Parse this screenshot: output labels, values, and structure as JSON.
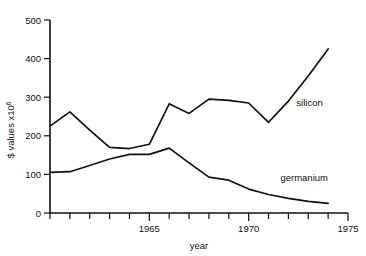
{
  "chart_data": {
    "type": "line",
    "title": "",
    "xlabel": "year",
    "ylabel": "$ values x10",
    "ylabel_exponent": "6",
    "xlim": [
      1960,
      1975
    ],
    "ylim": [
      0,
      500
    ],
    "grid": false,
    "legend_position": "inline-right",
    "x_ticks_major": [
      1965,
      1970,
      1975
    ],
    "x_tick_labels": [
      "1965",
      "1970",
      "1975"
    ],
    "x_ticks_all": [
      1960,
      1961,
      1962,
      1963,
      1964,
      1965,
      1966,
      1967,
      1968,
      1969,
      1970,
      1971,
      1972,
      1973,
      1974,
      1975
    ],
    "y_ticks": [
      0,
      100,
      200,
      300,
      400,
      500
    ],
    "y_tick_labels": [
      "0",
      "100",
      "200",
      "300",
      "400",
      "500"
    ],
    "x": [
      1960,
      1961,
      1962,
      1963,
      1964,
      1965,
      1966,
      1967,
      1968,
      1969,
      1970,
      1971,
      1972,
      1973,
      1974
    ],
    "series": [
      {
        "name": "silicon",
        "label": "silicon",
        "values": [
          225,
          262,
          215,
          170,
          167,
          178,
          283,
          258,
          295,
          292,
          285,
          235,
          290,
          355,
          425
        ]
      },
      {
        "name": "germanium",
        "label": "germanium",
        "values": [
          105,
          107,
          123,
          140,
          152,
          152,
          168,
          130,
          93,
          85,
          62,
          48,
          38,
          30,
          25
        ]
      }
    ],
    "annotations": [
      {
        "text": "silicon",
        "x": 1972.4,
        "y": 278
      },
      {
        "text": "germanium",
        "x": 1971.6,
        "y": 82
      }
    ]
  },
  "axes": {
    "y_axis_caption_prefix": "$ values x10",
    "y_axis_caption_sup": "6",
    "x_axis_caption": "year"
  }
}
